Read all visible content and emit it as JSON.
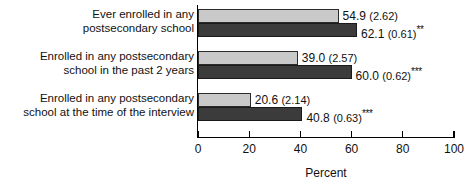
{
  "chart_data": {
    "type": "bar",
    "orientation": "horizontal",
    "title": "",
    "xlabel": "Percent",
    "ylabel": "",
    "xlim": [
      0,
      100
    ],
    "xticks": [
      0,
      20,
      40,
      60,
      80,
      100
    ],
    "grid": false,
    "legend": "none",
    "categories": [
      "Ever enrolled in any\npostsecondary school",
      "Enrolled in any postsecondary\nschool in the past 2 years",
      "Enrolled in any postsecondary\nschool at the time of the interview"
    ],
    "series": [
      {
        "name": "light-gray-series",
        "color": "#c9c9c9",
        "values": [
          54.9,
          39.0,
          20.6
        ],
        "std_errors": [
          2.62,
          2.57,
          2.14
        ],
        "significance": [
          "",
          "",
          ""
        ],
        "labels": [
          {
            "value": "54.9",
            "se": "(2.62)",
            "stars": ""
          },
          {
            "value": "39.0",
            "se": "(2.57)",
            "stars": ""
          },
          {
            "value": "20.6",
            "se": "(2.14)",
            "stars": ""
          }
        ]
      },
      {
        "name": "dark-gray-series",
        "color": "#3b3b3b",
        "values": [
          62.1,
          60.0,
          40.8
        ],
        "std_errors": [
          0.61,
          0.62,
          0.63
        ],
        "significance": [
          "**",
          "***",
          "***"
        ],
        "labels": [
          {
            "value": "62.1",
            "se": "(0.61)",
            "stars": "**"
          },
          {
            "value": "60.0",
            "se": "(0.62)",
            "stars": "***"
          },
          {
            "value": "40.8",
            "se": "(0.63)",
            "stars": "***"
          }
        ]
      }
    ],
    "tick_labels": [
      "0",
      "20",
      "40",
      "60",
      "80",
      "100"
    ]
  }
}
